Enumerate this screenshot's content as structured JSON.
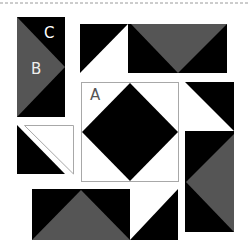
{
  "colors": {
    "dark": "#000000",
    "medium": "#555555",
    "light": "#ffffff",
    "outline": "#a8a8a8",
    "dashed_line": "#9a9a9a"
  },
  "labels": {
    "a": "A",
    "b": "B",
    "c": "C"
  },
  "pieces": [
    {
      "id": "left-flying-geese-unit",
      "description": "Vertical unit: medium triangle (B) pointing right on dark background (C)"
    },
    {
      "id": "top-unit",
      "description": "Half-square triangle (dark/light) plus flying geese with medium triangle pointing down"
    },
    {
      "id": "center-square-in-square",
      "description": "Block A: dark diamond with light corners"
    },
    {
      "id": "right-unit",
      "description": "Half-square triangle (dark/light) plus flying geese with medium triangle pointing left"
    },
    {
      "id": "left-hst-pieces",
      "description": "Separated half-square triangle: dark lower-left, light upper-right"
    },
    {
      "id": "bottom-unit",
      "description": "Flying geese with medium triangle pointing up plus half-square triangle (light/dark)"
    }
  ]
}
